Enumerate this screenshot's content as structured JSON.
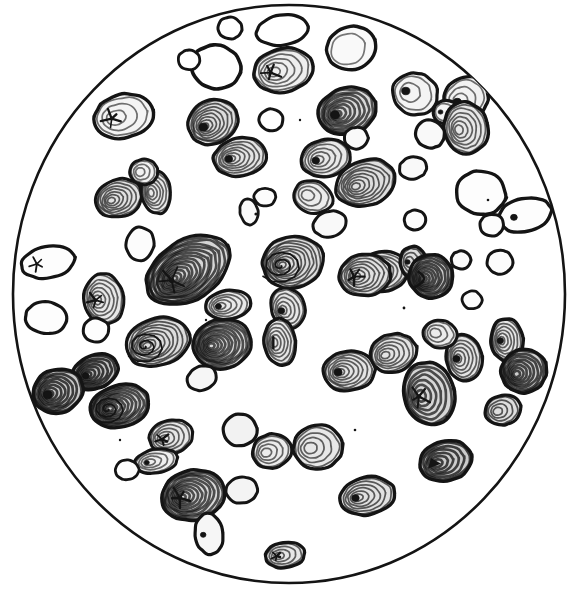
{
  "figure": {
    "domain": "natural-image-illustration",
    "kind": "scientific-engraving",
    "caption": "",
    "title": "",
    "label": "",
    "background_color": "#ffffff",
    "ink_color": "#141414",
    "shade_color": "#8a8a8a",
    "canvas": {
      "width": 574,
      "height": 594
    }
  },
  "field_of_view": {
    "shape": "circle",
    "name": "microscope-field-circle",
    "center_x": 289,
    "center_y": 294,
    "radius_x": 276,
    "radius_y": 289,
    "outline_width": 2.6,
    "outline_color": "#141414",
    "fill": "#ffffff"
  },
  "render": {
    "ring_stroke_width": 1.5,
    "outline_stroke_width": 3.0,
    "hilum_color": "#141414",
    "shading_opacity": 0.42,
    "grain_count": 74
  },
  "grains": [
    {
      "id": "g01",
      "cx": 230,
      "cy": 28,
      "rx": 12,
      "ry": 11,
      "rot": 10,
      "rings": 0,
      "shade": 0.0,
      "hilum": "none",
      "outline": 3.0
    },
    {
      "id": "g02",
      "cx": 282,
      "cy": 30,
      "rx": 26,
      "ry": 15,
      "rot": -8,
      "rings": 0,
      "shade": 0.0,
      "hilum": "none",
      "outline": 3.2
    },
    {
      "id": "g03",
      "cx": 351,
      "cy": 48,
      "rx": 25,
      "ry": 22,
      "rot": -20,
      "rings": 1,
      "shade": 0.05,
      "hilum": "none",
      "outline": 3.4
    },
    {
      "id": "g04",
      "cx": 216,
      "cy": 67,
      "rx": 25,
      "ry": 22,
      "rot": 12,
      "rings": 0,
      "shade": 0.0,
      "hilum": "none",
      "outline": 3.6
    },
    {
      "id": "g05",
      "cx": 283,
      "cy": 70,
      "rx": 30,
      "ry": 22,
      "rot": -12,
      "rings": 5,
      "shade": 0.15,
      "hilum": "star",
      "outline": 3.4
    },
    {
      "id": "g06",
      "cx": 415,
      "cy": 94,
      "rx": 23,
      "ry": 21,
      "rot": 18,
      "rings": 2,
      "shade": 0.1,
      "hilum": "dot",
      "outline": 3.2
    },
    {
      "id": "g07",
      "cx": 347,
      "cy": 111,
      "rx": 30,
      "ry": 23,
      "rot": -18,
      "rings": 8,
      "shade": 0.35,
      "hilum": "dot",
      "outline": 3.4
    },
    {
      "id": "g08",
      "cx": 466,
      "cy": 98,
      "rx": 23,
      "ry": 21,
      "rot": -25,
      "rings": 3,
      "shade": 0.12,
      "hilum": "dot",
      "outline": 3.4
    },
    {
      "id": "g09",
      "cx": 124,
      "cy": 116,
      "rx": 30,
      "ry": 22,
      "rot": -12,
      "rings": 3,
      "shade": 0.1,
      "hilum": "star",
      "outline": 3.4
    },
    {
      "id": "g10",
      "cx": 213,
      "cy": 122,
      "rx": 26,
      "ry": 22,
      "rot": -28,
      "rings": 8,
      "shade": 0.32,
      "hilum": "dot",
      "outline": 3.2
    },
    {
      "id": "g11",
      "cx": 446,
      "cy": 112,
      "rx": 13,
      "ry": 12,
      "rot": 0,
      "rings": 1,
      "shade": 0.1,
      "hilum": "dot",
      "outline": 3.2
    },
    {
      "id": "g12",
      "cx": 466,
      "cy": 128,
      "rx": 22,
      "ry": 26,
      "rot": -14,
      "rings": 6,
      "shade": 0.22,
      "hilum": "none",
      "outline": 3.4
    },
    {
      "id": "g13",
      "cx": 271,
      "cy": 120,
      "rx": 12,
      "ry": 11,
      "rot": 0,
      "rings": 0,
      "shade": 0.0,
      "hilum": "none",
      "outline": 3.0
    },
    {
      "id": "g14",
      "cx": 430,
      "cy": 134,
      "rx": 15,
      "ry": 14,
      "rot": 20,
      "rings": 0,
      "shade": 0.05,
      "hilum": "none",
      "outline": 3.2
    },
    {
      "id": "g15",
      "cx": 240,
      "cy": 157,
      "rx": 27,
      "ry": 19,
      "rot": -10,
      "rings": 7,
      "shade": 0.25,
      "hilum": "dot",
      "outline": 3.2
    },
    {
      "id": "g16",
      "cx": 326,
      "cy": 158,
      "rx": 25,
      "ry": 19,
      "rot": -14,
      "rings": 5,
      "shade": 0.2,
      "hilum": "dot",
      "outline": 3.2
    },
    {
      "id": "g17",
      "cx": 366,
      "cy": 183,
      "rx": 31,
      "ry": 23,
      "rot": -18,
      "rings": 8,
      "shade": 0.3,
      "hilum": "none",
      "outline": 3.2
    },
    {
      "id": "g18",
      "cx": 413,
      "cy": 168,
      "rx": 14,
      "ry": 11,
      "rot": -10,
      "rings": 0,
      "shade": 0.05,
      "hilum": "none",
      "outline": 3.0
    },
    {
      "id": "g19",
      "cx": 119,
      "cy": 198,
      "rx": 24,
      "ry": 19,
      "rot": -18,
      "rings": 7,
      "shade": 0.28,
      "hilum": "none",
      "outline": 3.0
    },
    {
      "id": "g20",
      "cx": 156,
      "cy": 192,
      "rx": 15,
      "ry": 22,
      "rot": -8,
      "rings": 6,
      "shade": 0.2,
      "hilum": "none",
      "outline": 3.0
    },
    {
      "id": "g21",
      "cx": 313,
      "cy": 197,
      "rx": 20,
      "ry": 16,
      "rot": 18,
      "rings": 3,
      "shade": 0.18,
      "hilum": "none",
      "outline": 3.0
    },
    {
      "id": "g22",
      "cx": 481,
      "cy": 193,
      "rx": 25,
      "ry": 22,
      "rot": 10,
      "rings": 0,
      "shade": 0.02,
      "hilum": "none",
      "outline": 3.4
    },
    {
      "id": "g23",
      "cx": 525,
      "cy": 215,
      "rx": 27,
      "ry": 17,
      "rot": -12,
      "rings": 0,
      "shade": 0.02,
      "hilum": "dot",
      "outline": 3.4
    },
    {
      "id": "g24",
      "cx": 249,
      "cy": 212,
      "rx": 9,
      "ry": 13,
      "rot": -12,
      "rings": 0,
      "shade": 0.05,
      "hilum": "none",
      "outline": 2.8
    },
    {
      "id": "g25",
      "cx": 48,
      "cy": 262,
      "rx": 27,
      "ry": 16,
      "rot": -10,
      "rings": 0,
      "shade": 0.02,
      "hilum": "star",
      "outline": 3.2
    },
    {
      "id": "g26",
      "cx": 140,
      "cy": 244,
      "rx": 14,
      "ry": 17,
      "rot": 8,
      "rings": 0,
      "shade": 0.03,
      "hilum": "none",
      "outline": 3.0
    },
    {
      "id": "g27",
      "cx": 188,
      "cy": 270,
      "rx": 46,
      "ry": 30,
      "rot": -32,
      "rings": 14,
      "shade": 0.38,
      "hilum": "star",
      "outline": 3.2
    },
    {
      "id": "g28",
      "cx": 293,
      "cy": 262,
      "rx": 31,
      "ry": 26,
      "rot": -16,
      "rings": 10,
      "shade": 0.32,
      "hilum": "spiral",
      "outline": 3.2
    },
    {
      "id": "g29",
      "cx": 382,
      "cy": 272,
      "rx": 27,
      "ry": 20,
      "rot": -8,
      "rings": 8,
      "shade": 0.25,
      "hilum": "star",
      "outline": 3.2
    },
    {
      "id": "g30",
      "cx": 413,
      "cy": 262,
      "rx": 13,
      "ry": 16,
      "rot": 0,
      "rings": 3,
      "shade": 0.3,
      "hilum": "dot",
      "outline": 3.4
    },
    {
      "id": "g31",
      "cx": 431,
      "cy": 276,
      "rx": 22,
      "ry": 22,
      "rot": -22,
      "rings": 9,
      "shade": 0.45,
      "hilum": "curve",
      "outline": 3.4
    },
    {
      "id": "g32",
      "cx": 461,
      "cy": 260,
      "rx": 10,
      "ry": 9,
      "rot": 0,
      "rings": 0,
      "shade": 0.05,
      "hilum": "none",
      "outline": 3.0
    },
    {
      "id": "g33",
      "cx": 500,
      "cy": 262,
      "rx": 13,
      "ry": 12,
      "rot": 0,
      "rings": 0,
      "shade": 0.03,
      "hilum": "none",
      "outline": 3.0
    },
    {
      "id": "g34",
      "cx": 104,
      "cy": 299,
      "rx": 20,
      "ry": 26,
      "rot": -8,
      "rings": 6,
      "shade": 0.22,
      "hilum": "star",
      "outline": 3.0
    },
    {
      "id": "g35",
      "cx": 46,
      "cy": 318,
      "rx": 21,
      "ry": 16,
      "rot": 8,
      "rings": 0,
      "shade": 0.02,
      "hilum": "none",
      "outline": 3.2
    },
    {
      "id": "g36",
      "cx": 228,
      "cy": 305,
      "rx": 23,
      "ry": 15,
      "rot": -8,
      "rings": 5,
      "shade": 0.2,
      "hilum": "dot",
      "outline": 3.2
    },
    {
      "id": "g37",
      "cx": 288,
      "cy": 308,
      "rx": 17,
      "ry": 21,
      "rot": -22,
      "rings": 5,
      "shade": 0.22,
      "hilum": "dot",
      "outline": 3.0
    },
    {
      "id": "g38",
      "cx": 280,
      "cy": 342,
      "rx": 16,
      "ry": 24,
      "rot": -6,
      "rings": 6,
      "shade": 0.22,
      "hilum": "slit",
      "outline": 3.2
    },
    {
      "id": "g39",
      "cx": 158,
      "cy": 342,
      "rx": 33,
      "ry": 24,
      "rot": -18,
      "rings": 9,
      "shade": 0.32,
      "hilum": "spiral",
      "outline": 3.2
    },
    {
      "id": "g40",
      "cx": 222,
      "cy": 344,
      "rx": 30,
      "ry": 25,
      "rot": -10,
      "rings": 11,
      "shade": 0.35,
      "hilum": "none",
      "outline": 3.2
    },
    {
      "id": "g41",
      "cx": 202,
      "cy": 378,
      "rx": 15,
      "ry": 12,
      "rot": -22,
      "rings": 0,
      "shade": 0.08,
      "hilum": "none",
      "outline": 3.0
    },
    {
      "id": "g42",
      "cx": 95,
      "cy": 372,
      "rx": 24,
      "ry": 17,
      "rot": -22,
      "rings": 7,
      "shade": 0.55,
      "hilum": "dot",
      "outline": 3.4
    },
    {
      "id": "g43",
      "cx": 58,
      "cy": 391,
      "rx": 26,
      "ry": 22,
      "rot": -20,
      "rings": 8,
      "shade": 0.5,
      "hilum": "dot",
      "outline": 3.4
    },
    {
      "id": "g44",
      "cx": 120,
      "cy": 406,
      "rx": 30,
      "ry": 21,
      "rot": -14,
      "rings": 10,
      "shade": 0.4,
      "hilum": "spiral",
      "outline": 3.4
    },
    {
      "id": "g45",
      "cx": 365,
      "cy": 275,
      "rx": 26,
      "ry": 21,
      "rot": -8,
      "rings": 7,
      "shade": 0.28,
      "hilum": "star",
      "outline": 3.2
    },
    {
      "id": "g46",
      "cx": 393,
      "cy": 353,
      "rx": 24,
      "ry": 19,
      "rot": -16,
      "rings": 6,
      "shade": 0.25,
      "hilum": "none",
      "outline": 3.2
    },
    {
      "id": "g47",
      "cx": 349,
      "cy": 371,
      "rx": 26,
      "ry": 20,
      "rot": -6,
      "rings": 7,
      "shade": 0.25,
      "hilum": "dot",
      "outline": 3.2
    },
    {
      "id": "g48",
      "cx": 464,
      "cy": 358,
      "rx": 18,
      "ry": 24,
      "rot": -6,
      "rings": 6,
      "shade": 0.25,
      "hilum": "dot",
      "outline": 3.2
    },
    {
      "id": "g49",
      "cx": 507,
      "cy": 340,
      "rx": 16,
      "ry": 22,
      "rot": -6,
      "rings": 6,
      "shade": 0.22,
      "hilum": "dot",
      "outline": 3.4
    },
    {
      "id": "g50",
      "cx": 524,
      "cy": 371,
      "rx": 23,
      "ry": 22,
      "rot": -22,
      "rings": 8,
      "shade": 0.45,
      "hilum": "none",
      "outline": 3.4
    },
    {
      "id": "g51",
      "cx": 429,
      "cy": 394,
      "rx": 25,
      "ry": 32,
      "rot": -14,
      "rings": 6,
      "shade": 0.38,
      "hilum": "star",
      "outline": 3.6
    },
    {
      "id": "g52",
      "cx": 440,
      "cy": 334,
      "rx": 17,
      "ry": 14,
      "rot": 12,
      "rings": 3,
      "shade": 0.18,
      "hilum": "none",
      "outline": 3.0
    },
    {
      "id": "g53",
      "cx": 171,
      "cy": 437,
      "rx": 22,
      "ry": 17,
      "rot": -14,
      "rings": 5,
      "shade": 0.22,
      "hilum": "star",
      "outline": 3.0
    },
    {
      "id": "g54",
      "cx": 240,
      "cy": 430,
      "rx": 17,
      "ry": 16,
      "rot": -6,
      "rings": 0,
      "shade": 0.12,
      "hilum": "none",
      "outline": 3.2
    },
    {
      "id": "g55",
      "cx": 272,
      "cy": 451,
      "rx": 20,
      "ry": 17,
      "rot": -16,
      "rings": 4,
      "shade": 0.18,
      "hilum": "none",
      "outline": 3.2
    },
    {
      "id": "g56",
      "cx": 318,
      "cy": 447,
      "rx": 25,
      "ry": 22,
      "rot": -8,
      "rings": 4,
      "shade": 0.22,
      "hilum": "none",
      "outline": 3.4
    },
    {
      "id": "g57",
      "cx": 156,
      "cy": 461,
      "rx": 22,
      "ry": 12,
      "rot": -10,
      "rings": 4,
      "shade": 0.15,
      "hilum": "dot",
      "outline": 3.0
    },
    {
      "id": "g58",
      "cx": 193,
      "cy": 495,
      "rx": 32,
      "ry": 25,
      "rot": -12,
      "rings": 10,
      "shade": 0.35,
      "hilum": "star",
      "outline": 3.4
    },
    {
      "id": "g59",
      "cx": 209,
      "cy": 534,
      "rx": 14,
      "ry": 21,
      "rot": -8,
      "rings": 0,
      "shade": 0.08,
      "hilum": "dot",
      "outline": 3.2
    },
    {
      "id": "g60",
      "cx": 285,
      "cy": 555,
      "rx": 20,
      "ry": 13,
      "rot": -8,
      "rings": 4,
      "shade": 0.22,
      "hilum": "star",
      "outline": 3.2
    },
    {
      "id": "g61",
      "cx": 367,
      "cy": 496,
      "rx": 28,
      "ry": 19,
      "rot": -10,
      "rings": 6,
      "shade": 0.28,
      "hilum": "dot",
      "outline": 3.4
    },
    {
      "id": "g62",
      "cx": 446,
      "cy": 461,
      "rx": 27,
      "ry": 20,
      "rot": -14,
      "rings": 6,
      "shade": 0.48,
      "hilum": "arrow",
      "outline": 3.4
    },
    {
      "id": "g63",
      "cx": 265,
      "cy": 197,
      "rx": 11,
      "ry": 9,
      "rot": 0,
      "rings": 0,
      "shade": 0.03,
      "hilum": "none",
      "outline": 2.8
    },
    {
      "id": "g64",
      "cx": 189,
      "cy": 60,
      "rx": 11,
      "ry": 10,
      "rot": 0,
      "rings": 0,
      "shade": 0.0,
      "hilum": "none",
      "outline": 2.8
    },
    {
      "id": "g65",
      "cx": 415,
      "cy": 220,
      "rx": 11,
      "ry": 10,
      "rot": 0,
      "rings": 0,
      "shade": 0.02,
      "hilum": "none",
      "outline": 3.0
    },
    {
      "id": "g66",
      "cx": 330,
      "cy": 224,
      "rx": 17,
      "ry": 13,
      "rot": -14,
      "rings": 0,
      "shade": 0.05,
      "hilum": "none",
      "outline": 3.0
    },
    {
      "id": "g67",
      "cx": 144,
      "cy": 172,
      "rx": 14,
      "ry": 13,
      "rot": 0,
      "rings": 3,
      "shade": 0.12,
      "hilum": "none",
      "outline": 3.0
    },
    {
      "id": "g68",
      "cx": 96,
      "cy": 330,
      "rx": 13,
      "ry": 12,
      "rot": 0,
      "rings": 0,
      "shade": 0.02,
      "hilum": "none",
      "outline": 3.0
    },
    {
      "id": "g69",
      "cx": 492,
      "cy": 225,
      "rx": 12,
      "ry": 11,
      "rot": 0,
      "rings": 0,
      "shade": 0.03,
      "hilum": "none",
      "outline": 3.0
    },
    {
      "id": "g70",
      "cx": 242,
      "cy": 490,
      "rx": 16,
      "ry": 13,
      "rot": -10,
      "rings": 0,
      "shade": 0.1,
      "hilum": "none",
      "outline": 3.0
    },
    {
      "id": "g71",
      "cx": 356,
      "cy": 138,
      "rx": 12,
      "ry": 11,
      "rot": 0,
      "rings": 0,
      "shade": 0.05,
      "hilum": "none",
      "outline": 3.0
    },
    {
      "id": "g72",
      "cx": 127,
      "cy": 470,
      "rx": 12,
      "ry": 10,
      "rot": 0,
      "rings": 0,
      "shade": 0.02,
      "hilum": "none",
      "outline": 2.8
    },
    {
      "id": "g73",
      "cx": 472,
      "cy": 300,
      "rx": 10,
      "ry": 9,
      "rot": 0,
      "rings": 0,
      "shade": 0.03,
      "hilum": "none",
      "outline": 2.8
    },
    {
      "id": "g74",
      "cx": 503,
      "cy": 410,
      "rx": 18,
      "ry": 15,
      "rot": -14,
      "rings": 4,
      "shade": 0.3,
      "hilum": "none",
      "outline": 3.2
    }
  ],
  "specks": [
    {
      "cx": 256,
      "cy": 214,
      "r": 1.6
    },
    {
      "cx": 447,
      "cy": 417,
      "r": 1.6
    },
    {
      "cx": 404,
      "cy": 308,
      "r": 1.4
    },
    {
      "cx": 488,
      "cy": 200,
      "r": 1.3
    },
    {
      "cx": 206,
      "cy": 320,
      "r": 1.2
    },
    {
      "cx": 355,
      "cy": 430,
      "r": 1.3
    },
    {
      "cx": 120,
      "cy": 440,
      "r": 1.2
    },
    {
      "cx": 300,
      "cy": 120,
      "r": 1.2
    }
  ]
}
